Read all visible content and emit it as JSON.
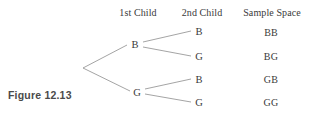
{
  "figure": {
    "caption": "Figure 12.13",
    "headers": [
      {
        "label": "1st Child",
        "x": 138
      },
      {
        "label": "2nd Child",
        "x": 202
      },
      {
        "label": "Sample Space",
        "x": 272
      }
    ],
    "root": {
      "x": 83,
      "y": 68
    },
    "level1_nodes": [
      {
        "label": "B",
        "x": 135,
        "y": 44
      },
      {
        "label": "G",
        "x": 137,
        "y": 92
      }
    ],
    "level2_nodes": [
      {
        "label": "B",
        "x": 199,
        "y": 31
      },
      {
        "label": "G",
        "x": 199,
        "y": 56
      },
      {
        "label": "B",
        "x": 199,
        "y": 79
      },
      {
        "label": "G",
        "x": 199,
        "y": 102
      }
    ],
    "sample_space": [
      {
        "label": "BB",
        "x": 271,
        "y": 32
      },
      {
        "label": "BG",
        "x": 271,
        "y": 56
      },
      {
        "label": "GB",
        "x": 271,
        "y": 79
      },
      {
        "label": "GG",
        "x": 271,
        "y": 102
      }
    ],
    "line_color": "#8d8d8d",
    "background_color": "#ffffff",
    "text_color": "#3a3a3a"
  }
}
